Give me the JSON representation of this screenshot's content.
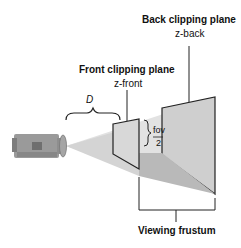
{
  "diagram": {
    "back_plane": {
      "title": "Back clipping plane",
      "sub": "z-back"
    },
    "front_plane": {
      "title": "Front clipping plane",
      "sub": "z-front"
    },
    "distance_label": "D",
    "fov_label": {
      "num": "fov",
      "den": "2"
    },
    "frustum_label": "Viewing frustum",
    "colors": {
      "frustum_fill": "#c9c9c9",
      "beam": "#d9d9d9",
      "line": "#222222"
    }
  }
}
